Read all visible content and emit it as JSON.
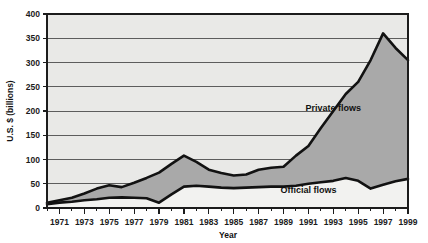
{
  "chart_data": {
    "type": "area",
    "title": "",
    "subtitle": "",
    "xlabel": "Year",
    "ylabel": "U.S. $ (billions)",
    "stacked": true,
    "grid": true,
    "legend_position": "inline-annotation",
    "xlim": [
      1970,
      1999
    ],
    "ylim": [
      0,
      400
    ],
    "yticks": [
      0,
      50,
      100,
      150,
      200,
      250,
      300,
      350,
      400
    ],
    "ytick_labels": [
      "0",
      "50",
      "100",
      "150",
      "200",
      "250",
      "300",
      "350",
      "400"
    ],
    "xticks": [
      1971,
      1973,
      1975,
      1977,
      1979,
      1981,
      1983,
      1985,
      1987,
      1989,
      1991,
      1993,
      1995,
      1997,
      1999
    ],
    "xtick_labels": [
      "1971",
      "1973",
      "1975",
      "1977",
      "1979",
      "1981",
      "1983",
      "1985",
      "1987",
      "1989",
      "1991",
      "1993",
      "1995",
      "1997",
      "1999"
    ],
    "x": [
      1970,
      1971,
      1972,
      1973,
      1974,
      1975,
      1976,
      1977,
      1978,
      1979,
      1980,
      1981,
      1982,
      1983,
      1984,
      1985,
      1986,
      1987,
      1988,
      1989,
      1990,
      1991,
      1992,
      1993,
      1994,
      1995,
      1996,
      1997,
      1998,
      1999
    ],
    "series": [
      {
        "name": "Official flows",
        "color": "#f2f2f0",
        "values": [
          8,
          11,
          13,
          16,
          18,
          21,
          22,
          21,
          20,
          11,
          28,
          44,
          46,
          44,
          42,
          41,
          42,
          43,
          44,
          44,
          46,
          50,
          53,
          56,
          62,
          56,
          40,
          48,
          55,
          60
        ]
      },
      {
        "name": "Private flows",
        "color": "#a9a9a9",
        "values": [
          3,
          5,
          8,
          14,
          22,
          26,
          21,
          31,
          42,
          62,
          63,
          64,
          49,
          35,
          30,
          26,
          27,
          36,
          39,
          41,
          62,
          78,
          112,
          144,
          173,
          204,
          265,
          312,
          275,
          245
        ]
      }
    ],
    "totals": [
      11,
      16,
      21,
      30,
      40,
      47,
      43,
      52,
      62,
      73,
      91,
      108,
      95,
      79,
      72,
      67,
      69,
      79,
      83,
      85,
      108,
      128,
      165,
      200,
      235,
      260,
      305,
      360,
      330,
      305
    ],
    "annotations": [
      {
        "text": "Private flows",
        "x": 1993,
        "y": 200
      },
      {
        "text": "Official flows",
        "x": 1991,
        "y": 30
      }
    ]
  },
  "colors": {
    "plot_background": "#e9e9e7",
    "gridline": "#5d5d5d",
    "frame": "#1c1c1c",
    "curve": "#121212",
    "private_fill": "#a9a9a9",
    "official_fill": "#f2f2f0",
    "text": "#111111"
  }
}
